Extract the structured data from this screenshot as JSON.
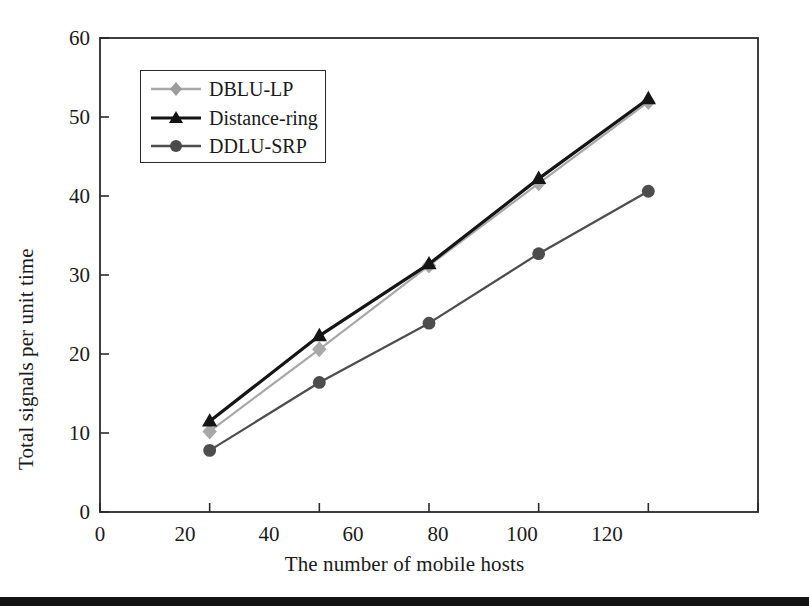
{
  "chart_data": {
    "type": "line",
    "title": "",
    "xlabel": "The number of mobile hosts",
    "ylabel": "Total signals per unit time",
    "x": [
      20,
      40,
      60,
      80,
      100
    ],
    "xlim": [
      0,
      120
    ],
    "ylim": [
      0,
      60
    ],
    "xticks": [
      0,
      20,
      40,
      60,
      80,
      100,
      120
    ],
    "yticks": [
      0,
      10,
      20,
      30,
      40,
      50,
      60
    ],
    "grid": false,
    "legend_position": "upper-left-inside",
    "series": [
      {
        "name": "DBLU-LP",
        "marker": "diamond",
        "color": "#a8a8a8",
        "values": [
          10.2,
          20.6,
          31.2,
          41.6,
          51.9
        ]
      },
      {
        "name": "Distance-ring",
        "marker": "triangle",
        "color": "#151515",
        "values": [
          11.5,
          22.3,
          31.4,
          42.2,
          52.3
        ]
      },
      {
        "name": "DDLU-SRP",
        "marker": "circle",
        "color": "#4d4d4d",
        "values": [
          7.8,
          16.4,
          23.9,
          32.7,
          40.6
        ]
      }
    ]
  },
  "axis": {
    "xtick_labels": [
      "0",
      "20",
      "40",
      "60",
      "80",
      "100",
      "120"
    ],
    "ytick_labels": [
      "0",
      "10",
      "20",
      "30",
      "40",
      "50",
      "60"
    ]
  },
  "legend": {
    "items": [
      {
        "label": "DBLU-LP"
      },
      {
        "label": "Distance-ring"
      },
      {
        "label": "DDLU-SRP"
      }
    ]
  },
  "style": {
    "frame_color": "#2a2a2a",
    "page_background": "#ffffff",
    "footer_bar_color": "#141414"
  }
}
